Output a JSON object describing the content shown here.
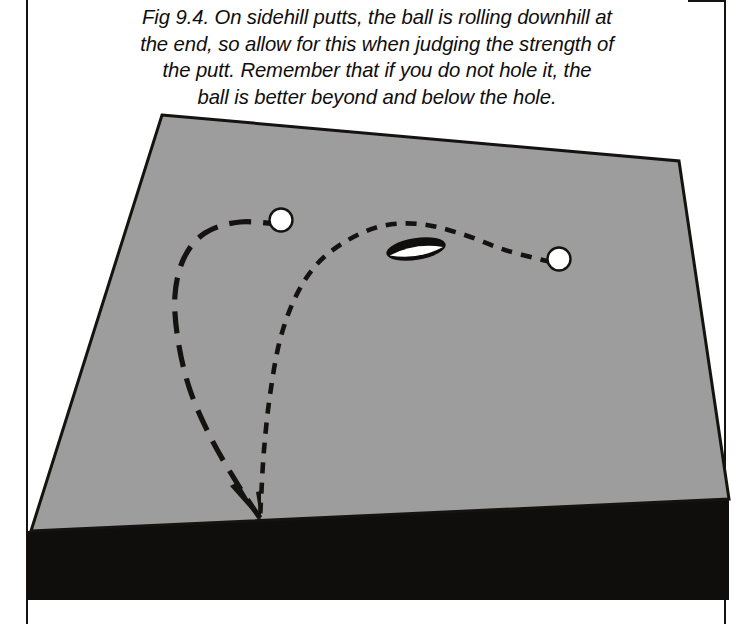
{
  "figure": {
    "label": "Fig 9.4.",
    "caption": "Fig 9.4. On sidehill putts, the ball is rolling downhill at the end, so allow for this when judging the strength of the putt. Remember that if you do not hole it, the ball is better beyond and below the hole.",
    "caption_lines": [
      "Fig 9.4. On sidehill putts, the ball is rolling downhill at",
      "the end, so allow for this when judging the strength of",
      "the putt. Remember that if you do not hole it, the",
      "ball is better beyond and below the hole."
    ]
  },
  "colors": {
    "page_background": "#ffffff",
    "green_surface": "#9d9d9d",
    "green_outline": "#15130f",
    "shadow_band": "#100e0c",
    "ball_fill": "#ffffff",
    "ball_outline": "#15130f",
    "hole_fill": "#100e0c",
    "hole_highlight": "#ffffff",
    "putt_line": "#15130f",
    "frame_rule": "#15130f",
    "caption_text": "#100e0c"
  },
  "diagram": {
    "green": {
      "name": "putting-green-surface",
      "shape": "quadrilateral in perspective",
      "corners": [
        {
          "label": "top-left",
          "x": 162,
          "y": 115
        },
        {
          "label": "top-right",
          "x": 679,
          "y": 161
        },
        {
          "label": "bottom-right",
          "x": 729,
          "y": 499
        },
        {
          "label": "bottom-left",
          "x": 31,
          "y": 531
        }
      ]
    },
    "shadow": {
      "name": "green-shadow-band",
      "corners": [
        {
          "x": 27,
          "y": 531
        },
        {
          "x": 729,
          "y": 497
        },
        {
          "x": 729,
          "y": 600
        },
        {
          "x": 27,
          "y": 600
        }
      ]
    },
    "balls": [
      {
        "name": "ball-left-upper",
        "role": "ball holed out on long break line",
        "cx": 281,
        "cy": 220,
        "r": 11.5
      },
      {
        "name": "ball-right-lower",
        "role": "ball starting the short putt from below",
        "cx": 559,
        "cy": 259,
        "r": 11.5
      }
    ],
    "hole": {
      "name": "hole-cup",
      "cx": 416,
      "cy": 249,
      "rx": 30,
      "ry": 11,
      "rotation_deg": -9
    },
    "putt_paths": [
      {
        "name": "putt-path-long-dash",
        "style": "long-dash",
        "dash_pattern": "22 12",
        "stroke_width": 5.2,
        "description": "left break curve from upper ball sweeping left then downhill to finish point",
        "points": [
          {
            "x": 285,
            "y": 225
          },
          {
            "x": 240,
            "y": 222
          },
          {
            "x": 205,
            "y": 233
          },
          {
            "x": 184,
            "y": 258
          },
          {
            "x": 175,
            "y": 295
          },
          {
            "x": 178,
            "y": 340
          },
          {
            "x": 190,
            "y": 390
          },
          {
            "x": 212,
            "y": 440
          },
          {
            "x": 240,
            "y": 488
          },
          {
            "x": 262,
            "y": 521
          }
        ]
      },
      {
        "name": "putt-path-short-dash",
        "style": "short-dash",
        "dash_pattern": "11 9",
        "stroke_width": 4.6,
        "description": "right curve from lower ball running past the hole then bending steeply downhill to finish point",
        "points": [
          {
            "x": 551,
            "y": 262
          },
          {
            "x": 505,
            "y": 250
          },
          {
            "x": 462,
            "y": 234
          },
          {
            "x": 420,
            "y": 224
          },
          {
            "x": 382,
            "y": 226
          },
          {
            "x": 348,
            "y": 240
          },
          {
            "x": 318,
            "y": 263
          },
          {
            "x": 296,
            "y": 296
          },
          {
            "x": 280,
            "y": 340
          },
          {
            "x": 270,
            "y": 395
          },
          {
            "x": 264,
            "y": 450
          },
          {
            "x": 261,
            "y": 500
          },
          {
            "x": 260,
            "y": 521
          }
        ]
      }
    ],
    "finish_marker": {
      "name": "putt-finish-point",
      "x": 262,
      "y": 522,
      "description": "converging tapered tip where both putt lines end below the hole"
    }
  }
}
